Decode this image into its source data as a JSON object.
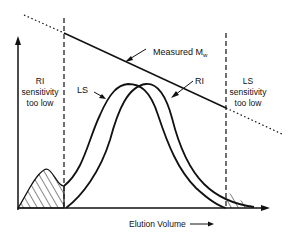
{
  "diagram": {
    "type": "chromatogram",
    "colors": {
      "ink": "#111111",
      "background": "#ffffff"
    },
    "labels": {
      "measured_mw": "Measured M",
      "measured_mw_sub": "w",
      "ri_curve": "RI",
      "ls_curve": "LS",
      "ri_region_line1": "RI",
      "ri_region_line2": "sensitivity",
      "ri_region_line3": "too low",
      "ls_region_line1": "LS",
      "ls_region_line2": "sensitivity",
      "ls_region_line3": "too low",
      "x_axis": "Elution Volume"
    }
  }
}
